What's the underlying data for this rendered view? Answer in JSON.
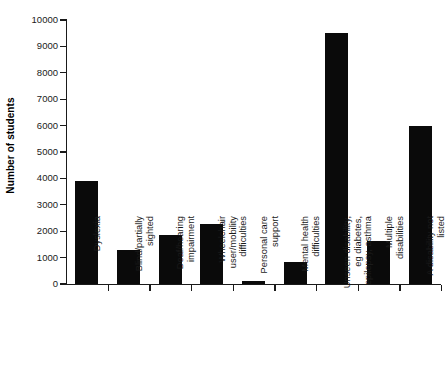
{
  "chart_data": {
    "type": "bar",
    "title": "",
    "xlabel": "",
    "ylabel": "Number of students",
    "ylim": [
      0,
      10000
    ],
    "ytick_values": [
      0,
      1000,
      2000,
      3000,
      4000,
      5000,
      6000,
      7000,
      8000,
      9000,
      10000
    ],
    "ytick_labels": [
      "0",
      "1000",
      "2000",
      "3000",
      "4000",
      "5000",
      "6000",
      "7000",
      "8000",
      "9000",
      "10000"
    ],
    "grid": false,
    "legend": null,
    "bar_color": "#0a0a0a",
    "categories": [
      "Dyslexia",
      "Blind/partially sighted",
      "Deaf/hearing impairment",
      "Wheelchair user/mobility difficulties",
      "Personal care support",
      "Mental health difficulties",
      "Unseen disability, eg diabetes, epilepsy, asthma",
      "Multiple disabilities",
      "A disability not listed"
    ],
    "category_lines": [
      [
        "Dyslexia"
      ],
      [
        "Blind/partially",
        "sighted"
      ],
      [
        "Deaf/hearing",
        "impairment"
      ],
      [
        "Wheelchair",
        "user/mobility",
        "difficulties"
      ],
      [
        "Personal care",
        "support"
      ],
      [
        "Mental health",
        "difficulties"
      ],
      [
        "Unseen disability,",
        "eg diabetes,",
        "epilepsy, asthma"
      ],
      [
        "Multiple",
        "disabilities"
      ],
      [
        "A disability not",
        "listed"
      ]
    ],
    "values": [
      3900,
      1280,
      1850,
      2270,
      110,
      830,
      9500,
      1620,
      6000
    ]
  }
}
